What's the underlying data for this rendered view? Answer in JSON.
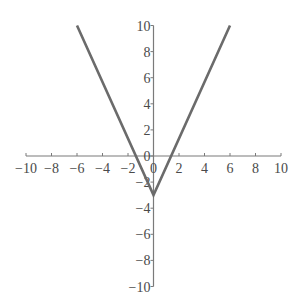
{
  "chart_data": {
    "type": "line",
    "title": "",
    "xlabel": "",
    "ylabel": "",
    "xlim": [
      -10,
      10
    ],
    "ylim": [
      -10,
      10
    ],
    "grid": false,
    "legend": null,
    "x_ticks": [
      -10,
      -8,
      -6,
      -4,
      -2,
      0,
      2,
      4,
      6,
      8,
      10
    ],
    "y_ticks": [
      -10,
      -8,
      -6,
      -4,
      -2,
      0,
      2,
      4,
      6,
      8,
      10
    ],
    "x_tick_labels": [
      "-10",
      "-8",
      "-6",
      "-4",
      "-2",
      "0",
      "2",
      "4",
      "6",
      "8",
      "10"
    ],
    "y_tick_labels": [
      "-10",
      "-8",
      "-6",
      "-4",
      "-2",
      "0",
      "2",
      "4",
      "6",
      "8",
      "10"
    ],
    "series": [
      {
        "name": "V-shaped absolute value graph",
        "x": [
          -6,
          0,
          6
        ],
        "y": [
          10,
          -3,
          10
        ],
        "color": "#6b6b6b",
        "vertex": [
          0,
          -3
        ],
        "x_intercepts": [
          -1.38,
          1.38
        ],
        "y_intercept": -3
      }
    ]
  },
  "colors": {
    "axis": "#7a7a7a",
    "line": "#6b6b6b",
    "text": "#4a4a4a",
    "background": "#ffffff"
  }
}
